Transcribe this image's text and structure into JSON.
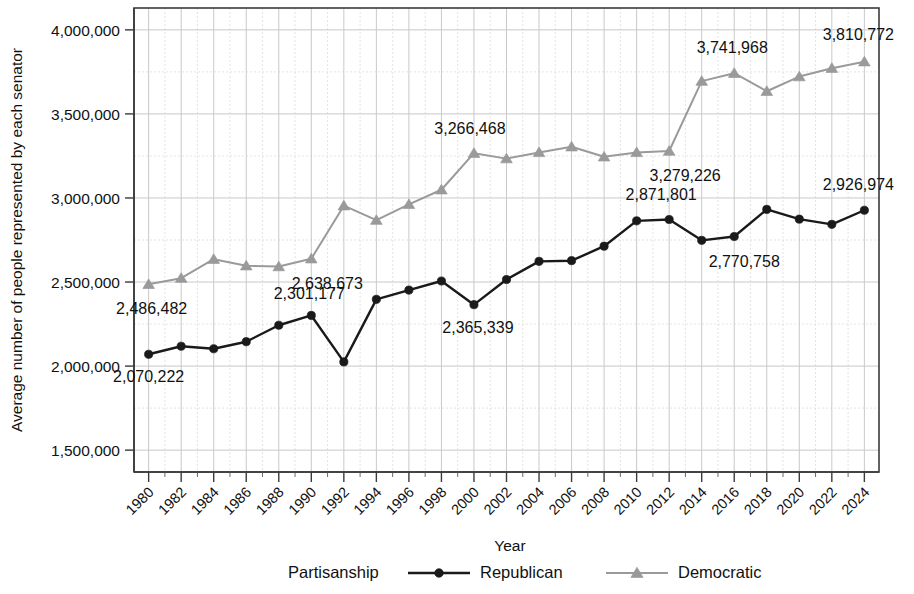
{
  "chart_data": {
    "type": "line",
    "title": "",
    "xlabel": "Year",
    "ylabel": "Average number of people represented by each senator",
    "x": [
      1980,
      1982,
      1984,
      1986,
      1988,
      1990,
      1992,
      1994,
      1996,
      1998,
      2000,
      2002,
      2004,
      2006,
      2008,
      2010,
      2012,
      2014,
      2016,
      2018,
      2020,
      2022,
      2024
    ],
    "xtick_labels": [
      "1980",
      "1982",
      "1984",
      "1986",
      "1988",
      "1990",
      "1992",
      "1994",
      "1996",
      "1998",
      "2000",
      "2002",
      "2004",
      "2006",
      "2008",
      "2010",
      "2012",
      "2014",
      "2016",
      "2018",
      "2020",
      "2022",
      "2024"
    ],
    "ytick_labels": [
      "1,500,000",
      "2,000,000",
      "2,500,000",
      "3,000,000",
      "3,500,000",
      "4,000,000"
    ],
    "ytick_values": [
      1500000,
      2000000,
      2500000,
      3000000,
      3500000,
      4000000
    ],
    "yminor_step": 250000,
    "ylim": [
      1370000,
      4130000
    ],
    "xlim": [
      1979.1,
      2024.9
    ],
    "grid": true,
    "legend_position": "bottom",
    "legend_title": "Partisanship",
    "series": [
      {
        "name": "Republican",
        "color": "#1a1a1a",
        "marker": "circle",
        "values": [
          2070222,
          2118000,
          2103000,
          2145000,
          2243000,
          2301177,
          2025000,
          2397000,
          2452000,
          2506000,
          2365339,
          2515000,
          2623000,
          2627000,
          2713000,
          2864000,
          2871801,
          2748000,
          2770758,
          2932000,
          2874000,
          2843000,
          2926974
        ]
      },
      {
        "name": "Democratic",
        "color": "#9a9a9a",
        "marker": "triangle",
        "values": [
          2486482,
          2523000,
          2636000,
          2597000,
          2592000,
          2638673,
          2954000,
          2868000,
          2962000,
          3049000,
          3266468,
          3234000,
          3271000,
          3305000,
          3245000,
          3271000,
          3279226,
          3695000,
          3741968,
          3635000,
          3722000,
          3772000,
          3810772
        ]
      }
    ],
    "annotations": [
      {
        "series": "Republican",
        "x": 1980,
        "value": 2070222,
        "text": "2,070,222",
        "dx": 0,
        "dy": 28,
        "anchor": "middle"
      },
      {
        "series": "Republican",
        "x": 1990,
        "value": 2301177,
        "text": "2,301,177",
        "dx": -2,
        "dy": -16,
        "anchor": "middle"
      },
      {
        "series": "Republican",
        "x": 2000,
        "value": 2365339,
        "text": "2,365,339",
        "dx": 4,
        "dy": 28,
        "anchor": "middle"
      },
      {
        "series": "Republican",
        "x": 2012,
        "value": 2871801,
        "text": "2,871,801",
        "dx": -8,
        "dy": -20,
        "anchor": "middle"
      },
      {
        "series": "Republican",
        "x": 2016,
        "value": 2770758,
        "text": "2,770,758",
        "dx": 10,
        "dy": 30,
        "anchor": "middle"
      },
      {
        "series": "Republican",
        "x": 2024,
        "value": 2926974,
        "text": "2,926,974",
        "dx": -6,
        "dy": -20,
        "anchor": "middle"
      },
      {
        "series": "Democratic",
        "x": 1980,
        "value": 2486482,
        "text": "2,486,482",
        "dx": 3,
        "dy": 30,
        "anchor": "middle"
      },
      {
        "series": "Democratic",
        "x": 1990,
        "value": 2638673,
        "text": "2,638,673",
        "dx": 16,
        "dy": 30,
        "anchor": "middle"
      },
      {
        "series": "Democratic",
        "x": 2000,
        "value": 3266468,
        "text": "3,266,468",
        "dx": -4,
        "dy": -19,
        "anchor": "middle"
      },
      {
        "series": "Democratic",
        "x": 2012,
        "value": 3279226,
        "text": "3,279,226",
        "dx": 16,
        "dy": 30,
        "anchor": "middle"
      },
      {
        "series": "Democratic",
        "x": 2016,
        "value": 3741968,
        "text": "3,741,968",
        "dx": -2,
        "dy": -20,
        "anchor": "middle"
      },
      {
        "series": "Democratic",
        "x": 2024,
        "value": 3810772,
        "text": "3,810,772",
        "dx": -6,
        "dy": -22,
        "anchor": "middle"
      }
    ]
  },
  "legend": {
    "title": "Partisanship",
    "entries": [
      {
        "label": "Republican",
        "color": "#1a1a1a",
        "marker": "circle"
      },
      {
        "label": "Democratic",
        "color": "#9a9a9a",
        "marker": "triangle"
      }
    ]
  },
  "axes": {
    "x_title": "Year",
    "y_title": "Average number of people represented by each senator"
  }
}
